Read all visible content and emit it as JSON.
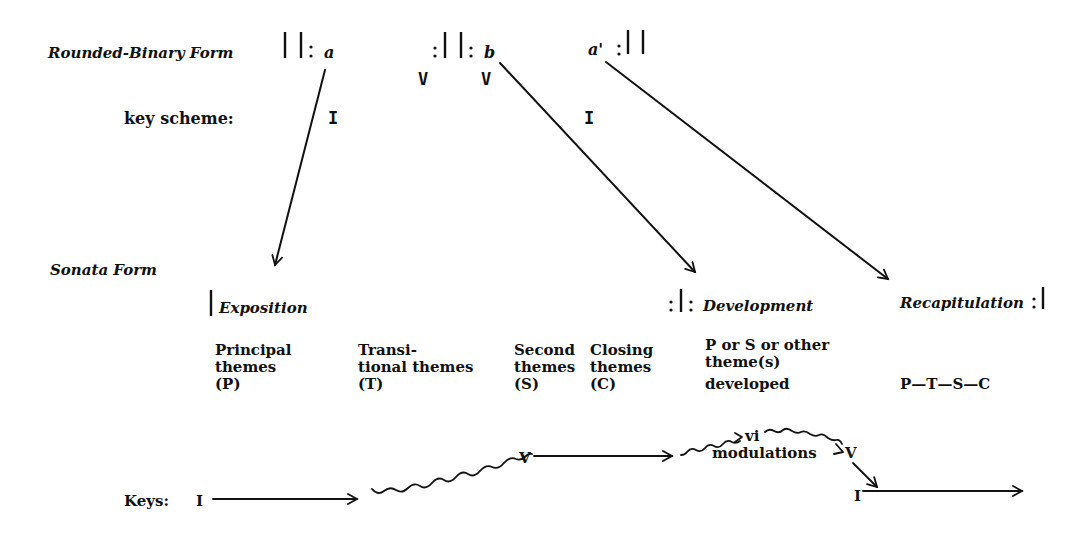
{
  "rounded_binary": {
    "label": "Rounded-Binary Form",
    "repeat_open_1": "||:",
    "section_a": "a",
    "repeat_close_open": ":||:",
    "section_b": "b",
    "section_a_prime": "a'",
    "repeat_close_2": ":||",
    "key_scheme_label": "key scheme:",
    "keys": [
      "I",
      "V",
      "V",
      "I"
    ]
  },
  "sonata": {
    "label": "Sonata Form",
    "exposition": "Exposition",
    "development": "Development",
    "development_marker": ":|:",
    "recapitulation": "Recapitulation",
    "recap_marker": ":|",
    "themes": [
      {
        "lines": [
          "Principal",
          "themes",
          "(P)"
        ]
      },
      {
        "lines": [
          "Transi-",
          "tional themes",
          "(T)"
        ]
      },
      {
        "lines": [
          "Second",
          "themes",
          "(S)"
        ]
      },
      {
        "lines": [
          "Closing",
          "themes",
          "(C)"
        ]
      },
      {
        "lines": [
          "P or S or other",
          "theme(s)",
          "developed"
        ]
      }
    ],
    "recap_sequence": "P—T—S—C"
  },
  "keys_row": {
    "label": "Keys:",
    "start": "I",
    "dominant": "V",
    "submediant": "vi",
    "modulations": "modulations",
    "dominant_2": "V",
    "tonic_return": "I"
  },
  "colors": {
    "ink": "#111111",
    "background": "#ffffff"
  }
}
